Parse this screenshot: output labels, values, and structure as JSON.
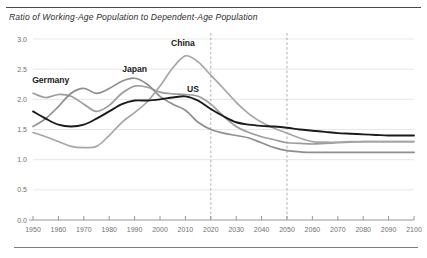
{
  "title": "Ratio of Working-Age Population to Dependent-Age Population",
  "chart_data": {
    "type": "line",
    "title": "Ratio of Working-Age Population to Dependent-Age Population",
    "xlabel": "",
    "ylabel": "",
    "xlim": [
      1950,
      2100
    ],
    "ylim": [
      0.0,
      3.0
    ],
    "grid": true,
    "legend_position": "inline-labels",
    "xticks": [
      1950,
      1960,
      1970,
      1980,
      1990,
      2000,
      2010,
      2020,
      2030,
      2040,
      2050,
      2060,
      2070,
      2080,
      2090,
      2100
    ],
    "xtick_labels": [
      "1950",
      "1960",
      "1970",
      "1980",
      "1990",
      "2000",
      "2010",
      "2020",
      "2030",
      "2040",
      "2050",
      "2060",
      "2070",
      "2080",
      "2090",
      "2100"
    ],
    "yticks": [
      0.0,
      0.5,
      1.0,
      1.5,
      2.0,
      2.5,
      3.0
    ],
    "ytick_labels": [
      "0.0",
      "0.5",
      "1.0",
      "1.5",
      "2.0",
      "2.5",
      "3.0"
    ],
    "annotations": [
      {
        "text": "2020",
        "type": "vertical-dashed-line",
        "x": 2020
      },
      {
        "text": "2050",
        "type": "vertical-dashed-line",
        "x": 2050
      }
    ],
    "series": [
      {
        "name": "Germany",
        "color": "#9c9c9c",
        "width": 1.7,
        "label_x": 1957,
        "label_y": 2.27,
        "x": [
          1950,
          1955,
          1960,
          1965,
          1970,
          1975,
          1980,
          1985,
          1990,
          1995,
          2000,
          2005,
          2010,
          2015,
          2020,
          2025,
          2030,
          2035,
          2040,
          2045,
          2050,
          2055,
          2060,
          2065,
          2070,
          2075,
          2080,
          2085,
          2090,
          2095,
          2100
        ],
        "values": [
          2.1,
          2.03,
          2.08,
          2.05,
          1.92,
          1.8,
          1.9,
          2.1,
          2.22,
          2.2,
          2.12,
          2.09,
          2.08,
          2.05,
          1.92,
          1.72,
          1.55,
          1.45,
          1.38,
          1.33,
          1.28,
          1.27,
          1.26,
          1.27,
          1.28,
          1.29,
          1.3,
          1.3,
          1.3,
          1.3,
          1.3
        ]
      },
      {
        "name": "Japan",
        "color": "#8e8e8e",
        "width": 1.7,
        "label_x": 1990,
        "label_y": 2.46,
        "x": [
          1950,
          1955,
          1960,
          1965,
          1970,
          1975,
          1980,
          1985,
          1990,
          1995,
          2000,
          2005,
          2010,
          2015,
          2020,
          2025,
          2030,
          2035,
          2040,
          2045,
          2050,
          2055,
          2060,
          2065,
          2070,
          2075,
          2080,
          2085,
          2090,
          2095,
          2100
        ],
        "values": [
          1.55,
          1.68,
          1.88,
          2.1,
          2.18,
          2.1,
          2.18,
          2.3,
          2.35,
          2.25,
          2.05,
          1.92,
          1.82,
          1.62,
          1.5,
          1.44,
          1.4,
          1.36,
          1.28,
          1.2,
          1.15,
          1.13,
          1.12,
          1.12,
          1.12,
          1.12,
          1.12,
          1.12,
          1.12,
          1.12,
          1.12
        ]
      },
      {
        "name": "China",
        "color": "#a6a6a6",
        "width": 1.7,
        "label_x": 2009,
        "label_y": 2.88,
        "x": [
          1950,
          1955,
          1960,
          1965,
          1970,
          1975,
          1980,
          1985,
          1990,
          1995,
          2000,
          2005,
          2010,
          2015,
          2020,
          2025,
          2030,
          2035,
          2040,
          2045,
          2050,
          2055,
          2060,
          2065,
          2070,
          2075,
          2080,
          2085,
          2090,
          2095,
          2100
        ],
        "values": [
          1.45,
          1.38,
          1.3,
          1.22,
          1.2,
          1.22,
          1.4,
          1.62,
          1.78,
          1.96,
          2.22,
          2.52,
          2.72,
          2.62,
          2.4,
          2.18,
          1.95,
          1.76,
          1.62,
          1.52,
          1.44,
          1.36,
          1.3,
          1.29,
          1.29,
          1.3,
          1.3,
          1.3,
          1.3,
          1.3,
          1.3
        ]
      },
      {
        "name": "US",
        "color": "#1a1a1a",
        "width": 1.9,
        "label_x": 2013,
        "label_y": 2.12,
        "x": [
          1950,
          1955,
          1960,
          1965,
          1970,
          1975,
          1980,
          1985,
          1990,
          1995,
          2000,
          2005,
          2010,
          2015,
          2020,
          2025,
          2030,
          2035,
          2040,
          2045,
          2050,
          2055,
          2060,
          2065,
          2070,
          2075,
          2080,
          2085,
          2090,
          2095,
          2100
        ],
        "values": [
          1.8,
          1.68,
          1.58,
          1.55,
          1.58,
          1.68,
          1.8,
          1.92,
          1.98,
          1.98,
          2.0,
          2.03,
          2.05,
          1.98,
          1.84,
          1.72,
          1.62,
          1.58,
          1.56,
          1.55,
          1.53,
          1.5,
          1.48,
          1.46,
          1.44,
          1.43,
          1.42,
          1.41,
          1.4,
          1.4,
          1.4
        ]
      }
    ]
  },
  "axes": {
    "plot_left": 33,
    "plot_right": 414,
    "plot_top": 39,
    "plot_bottom": 220
  }
}
